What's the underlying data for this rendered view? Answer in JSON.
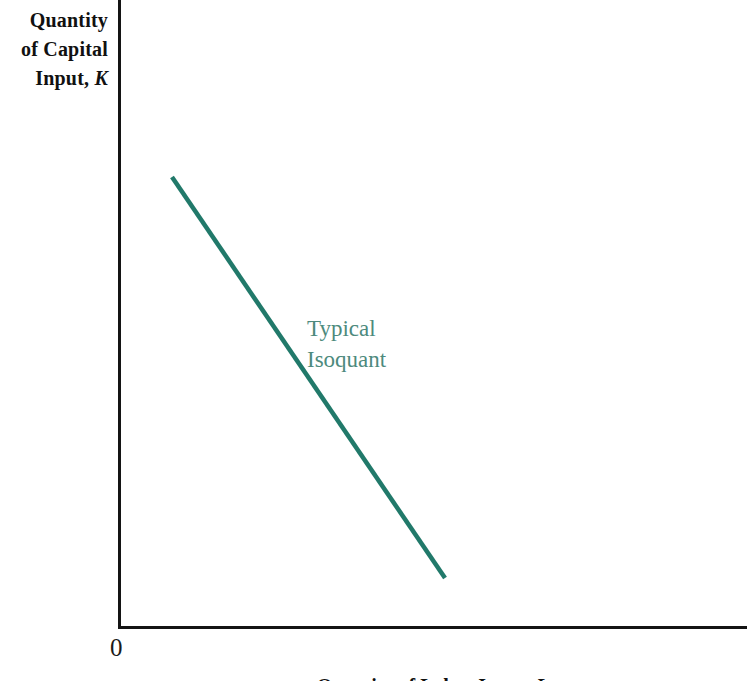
{
  "figure": {
    "background_color": "#ffffff",
    "axis_color": "#141414",
    "origin_label": "0"
  },
  "axes": {
    "y": {
      "label_line_1": "Quantity",
      "label_line_2": "of Capital",
      "label_line_3": "Input,",
      "label_variable": "K"
    },
    "x": {
      "label_text": "Quantity of Labor Input,",
      "label_variable": "L"
    }
  },
  "annotations": {
    "isoquant_label": "Typical\nIsoquant",
    "isoquant_label_color": "#4d8a7d"
  },
  "chart_data": {
    "type": "line",
    "title": "",
    "subtitle": "",
    "xlabel": "Quantity of Labor Input, L",
    "ylabel": "Quantity of Capital Input, K",
    "grid": false,
    "legend": null,
    "axis_style": "two-axis-L-frame, no tick marks, no tick labels",
    "xlim": [
      0,
      100
    ],
    "ylim": [
      0,
      100
    ],
    "annotations": [
      {
        "text": "Typical Isoquant",
        "x": 30,
        "y": 50,
        "color": "#4d8a7d"
      }
    ],
    "series": [
      {
        "name": "Typical Isoquant",
        "color": "#21796a",
        "linewidth": 4,
        "description": "Straight downward-sloping line segment (linear isoquant, perfect substitutes); constant marginal rate of technical substitution.",
        "x": [
          8.6,
          52.0
        ],
        "y": [
          71.8,
          7.9
        ],
        "points_px": [
          {
            "x": 172,
            "y": 177
          },
          {
            "x": 445,
            "y": 578
          }
        ]
      }
    ]
  }
}
